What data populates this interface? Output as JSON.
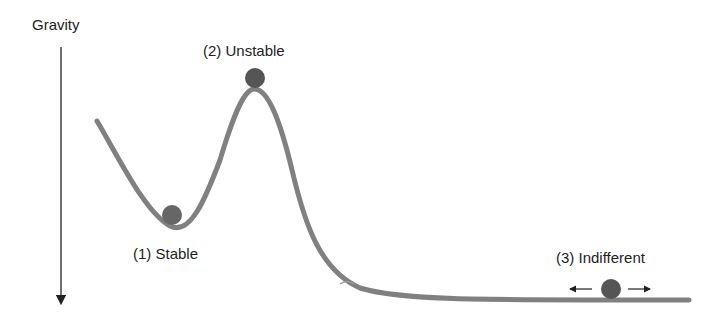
{
  "gravity": {
    "label": "Gravity"
  },
  "states": [
    {
      "label": "(1) Stable"
    },
    {
      "label": "(2) Unstable"
    },
    {
      "label": "(3) Indifferent"
    }
  ],
  "colors": {
    "curve": "#808080",
    "ball": "#555555",
    "text": "#222222",
    "arrow": "#222222"
  }
}
